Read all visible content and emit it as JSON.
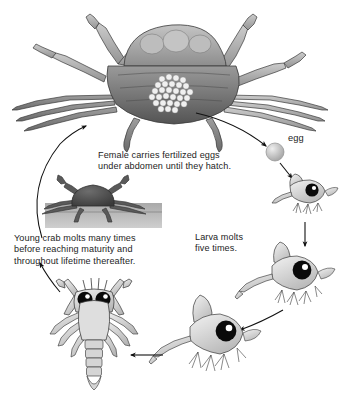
{
  "diagram": {
    "background_color": "#ffffff",
    "text_color": "#1d1d1d",
    "type": "cyclic-life-cycle-diagram",
    "stages_count": 6
  },
  "captions": {
    "female": "Female carries fertilized eggs\nunder abdomen until they hatch.",
    "egg": "egg",
    "larva": "Larva molts\nfive times.",
    "young_crab": "Young crab molts many times\nbefore reaching maturity and\nthroughout lifetime thereafter."
  },
  "stages": [
    {
      "id": "adult-female-crab",
      "label": "Female carries fertilized eggs under abdomen until they hatch."
    },
    {
      "id": "egg",
      "label": "egg"
    },
    {
      "id": "zoea-larva-1",
      "label": "Larva molts five times."
    },
    {
      "id": "zoea-larva-2",
      "label": "Larva molts five times."
    },
    {
      "id": "zoea-larva-3",
      "label": "Larva molts five times."
    },
    {
      "id": "megalopa",
      "label": "Megalopa stage"
    },
    {
      "id": "young-crab",
      "label": "Young crab molts many times before reaching maturity and throughout lifetime thereafter."
    }
  ],
  "palette": {
    "outline": "#2b2b2b",
    "shell_light": "#c9c9c9",
    "shell_mid": "#a3a3a3",
    "shell_dark": "#6f6f6f",
    "shell_darkest": "#4a4a4a",
    "egg_cluster": "#ededed",
    "larva_body": "#d8d8d8",
    "eye_black": "#0a0a0a",
    "eye_highlight": "#ffffff",
    "seafloor": "#b8b8b8",
    "young_crab_body": "#4f4f4f",
    "arrow": "#111111"
  }
}
